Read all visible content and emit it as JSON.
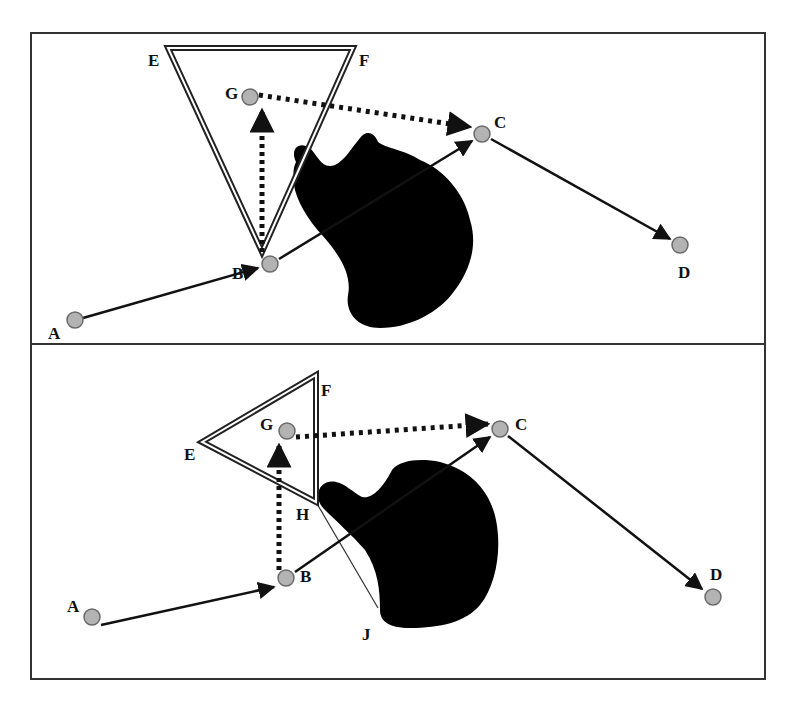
{
  "figure": {
    "frame": {
      "x": 31,
      "y": 33,
      "width": 734,
      "height": 646,
      "divider_y": 344
    },
    "colors": {
      "node_fill": "#b3b3b3",
      "node_stroke": "#6a6a6a",
      "line": "#111111",
      "obstacle": "#000000",
      "frame": "#333333"
    }
  },
  "panels": [
    {
      "id": "top",
      "nodes": [
        {
          "label": "A",
          "x": 75,
          "y": 320,
          "lx": 48,
          "ly": 339
        },
        {
          "label": "B",
          "x": 270,
          "y": 264,
          "lx": 232,
          "ly": 279
        },
        {
          "label": "C",
          "x": 482,
          "y": 134,
          "lx": 494,
          "ly": 128
        },
        {
          "label": "D",
          "x": 680,
          "y": 245,
          "lx": 678,
          "ly": 278
        },
        {
          "label": "G",
          "x": 250,
          "y": 97,
          "lx": 225,
          "ly": 99
        }
      ],
      "triangle": {
        "vertices": [
          [
            168,
            48
          ],
          [
            353,
            48
          ],
          [
            262,
            252
          ]
        ],
        "labels": [
          {
            "label": "E",
            "lx": 148,
            "ly": 66
          },
          {
            "label": "F",
            "lx": 359,
            "ly": 66
          }
        ]
      },
      "edges": [
        {
          "from": "A",
          "to": "B",
          "style": "solid"
        },
        {
          "from": "B",
          "to": "C",
          "style": "solid"
        },
        {
          "from": "C",
          "to": "D",
          "style": "solid"
        },
        {
          "from": "B",
          "to": "G",
          "style": "dotted"
        },
        {
          "from": "G",
          "to": "C",
          "style": "dotted"
        }
      ]
    },
    {
      "id": "bottom",
      "nodes": [
        {
          "label": "A",
          "x": 92,
          "y": 617,
          "lx": 67,
          "ly": 612
        },
        {
          "label": "B",
          "x": 286,
          "y": 578,
          "lx": 300,
          "ly": 582
        },
        {
          "label": "C",
          "x": 500,
          "y": 429,
          "lx": 515,
          "ly": 430
        },
        {
          "label": "D",
          "x": 713,
          "y": 597,
          "lx": 710,
          "ly": 580
        },
        {
          "label": "G",
          "x": 287,
          "y": 431,
          "lx": 260,
          "ly": 430
        }
      ],
      "triangle": {
        "vertices": [
          [
            202,
            442
          ],
          [
            316,
            375
          ],
          [
            316,
            502
          ]
        ],
        "labels": [
          {
            "label": "E",
            "lx": 184,
            "ly": 460
          },
          {
            "label": "F",
            "lx": 321,
            "ly": 396
          },
          {
            "label": "H",
            "lx": 296,
            "ly": 520
          }
        ]
      },
      "extra_labels": [
        {
          "label": "J",
          "lx": 362,
          "ly": 640
        }
      ],
      "edges": [
        {
          "from": "A",
          "to": "B",
          "style": "solid"
        },
        {
          "from": "B",
          "to": "C",
          "style": "solid"
        },
        {
          "from": "C",
          "to": "D",
          "style": "solid"
        },
        {
          "from": "B",
          "to": "G",
          "style": "dotted"
        },
        {
          "from": "G",
          "to": "C",
          "style": "dotted"
        }
      ],
      "thin_line": {
        "from": [
          316,
          502
        ],
        "to": [
          378,
          608
        ],
        "label": "H-J"
      }
    }
  ]
}
